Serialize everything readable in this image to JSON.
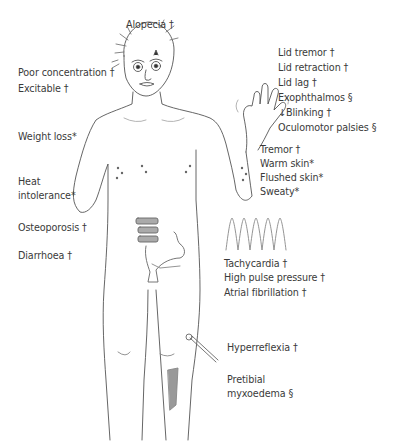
{
  "diagram": {
    "labels": {
      "alopecia": "Alopecia †",
      "poor_concentration": "Poor concentration †",
      "excitable": "Excitable †",
      "weight_loss": "Weight loss*",
      "heat_line1": "Heat",
      "heat_line2": "intolerance*",
      "osteoporosis": "Osteoporosis †",
      "diarrhoea": "Diarrhoea †",
      "lid_tremor": "Lid tremor †",
      "lid_retraction": "Lid retraction †",
      "lid_lag": "Lid lag †",
      "exophthalmos": "Exophthalmos §",
      "blinking": "↓Blinking †",
      "oculomotor": "Oculomotor palsies §",
      "tremor": "Tremor †",
      "warm_skin": "Warm skin*",
      "flushed_skin": "Flushed skin*",
      "sweaty": "Sweaty*",
      "tachycardia": "Tachycardia †",
      "pulse_pressure": "High pulse pressure †",
      "atrial_fib": "Atrial fibrillation †",
      "hyperreflexia": "Hyperreflexia †",
      "pretibial_line1": "Pretibial",
      "pretibial_line2": "myxoedema §"
    },
    "illustrations": [
      "human-figure",
      "thyroid-eyes",
      "spine-vertebrae",
      "bowel",
      "ecg-waveform",
      "reflex-hammer",
      "pretibial-shading"
    ]
  }
}
